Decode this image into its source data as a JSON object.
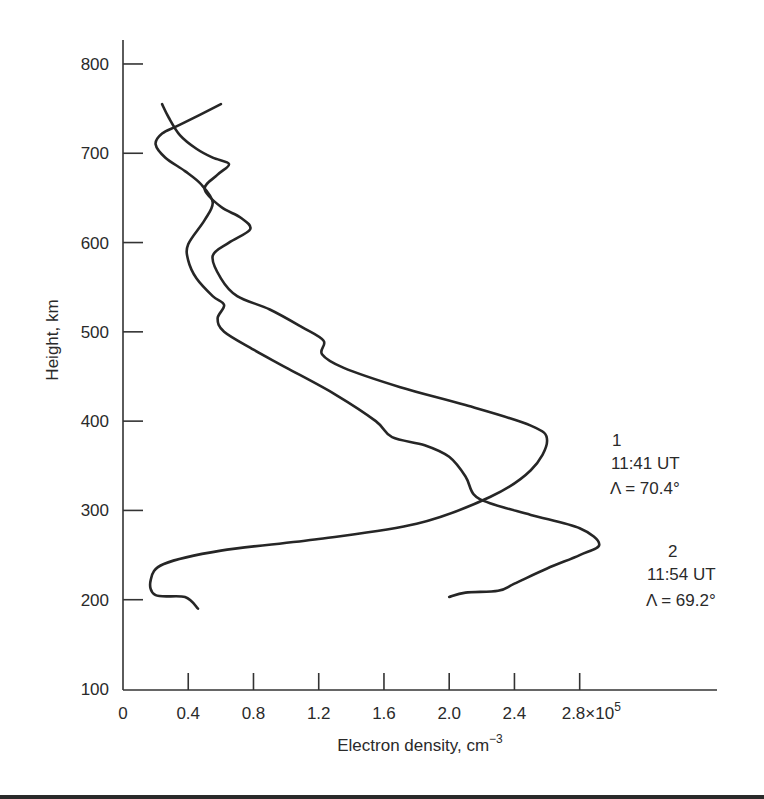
{
  "chart_data": {
    "type": "line",
    "title": "",
    "xlabel": "Electron density, cm⁻³",
    "ylabel": "Height, km",
    "xlim": [
      0,
      3.2
    ],
    "ylim": [
      100,
      830
    ],
    "x_multiplier": "×10⁵",
    "grid": false,
    "legend": "inline annotations",
    "x_ticks": [
      "0",
      "0.4",
      "0.8",
      "1.2",
      "1.6",
      "2.0",
      "2.4",
      "2.8×10⁵"
    ],
    "y_ticks": [
      "100",
      "200",
      "300",
      "400",
      "500",
      "600",
      "700",
      "800"
    ],
    "series": [
      {
        "name": "1",
        "time": "11:41 UT",
        "latitude": "Λ = 70.4°",
        "points": [
          [
            0.46,
            190
          ],
          [
            0.38,
            203
          ],
          [
            0.2,
            205
          ],
          [
            0.17,
            222
          ],
          [
            0.25,
            240
          ],
          [
            0.6,
            255
          ],
          [
            1.2,
            268
          ],
          [
            1.8,
            285
          ],
          [
            2.25,
            315
          ],
          [
            2.5,
            345
          ],
          [
            2.6,
            378
          ],
          [
            2.5,
            395
          ],
          [
            2.1,
            418
          ],
          [
            1.7,
            438
          ],
          [
            1.35,
            460
          ],
          [
            1.22,
            475
          ],
          [
            1.23,
            490
          ],
          [
            1.1,
            505
          ],
          [
            0.9,
            525
          ],
          [
            0.7,
            540
          ],
          [
            0.6,
            560
          ],
          [
            0.55,
            585
          ],
          [
            0.65,
            600
          ],
          [
            0.78,
            615
          ],
          [
            0.72,
            628
          ],
          [
            0.6,
            640
          ],
          [
            0.5,
            660
          ],
          [
            0.58,
            676
          ],
          [
            0.65,
            688
          ],
          [
            0.55,
            695
          ],
          [
            0.45,
            705
          ],
          [
            0.35,
            720
          ],
          [
            0.28,
            740
          ],
          [
            0.24,
            755
          ]
        ]
      },
      {
        "name": "2",
        "time": "11:54 UT",
        "latitude": "Λ = 69.2°",
        "points": [
          [
            2.0,
            203
          ],
          [
            2.1,
            208
          ],
          [
            2.3,
            210
          ],
          [
            2.4,
            218
          ],
          [
            2.6,
            235
          ],
          [
            2.8,
            250
          ],
          [
            2.92,
            262
          ],
          [
            2.8,
            280
          ],
          [
            2.5,
            295
          ],
          [
            2.25,
            308
          ],
          [
            2.15,
            318
          ],
          [
            2.1,
            338
          ],
          [
            2.0,
            360
          ],
          [
            1.85,
            373
          ],
          [
            1.65,
            382
          ],
          [
            1.55,
            400
          ],
          [
            1.3,
            430
          ],
          [
            1.0,
            460
          ],
          [
            0.8,
            480
          ],
          [
            0.62,
            500
          ],
          [
            0.58,
            515
          ],
          [
            0.62,
            530
          ],
          [
            0.55,
            540
          ],
          [
            0.45,
            560
          ],
          [
            0.4,
            580
          ],
          [
            0.4,
            598
          ],
          [
            0.5,
            625
          ],
          [
            0.55,
            645
          ],
          [
            0.48,
            665
          ],
          [
            0.38,
            680
          ],
          [
            0.26,
            695
          ],
          [
            0.2,
            710
          ],
          [
            0.24,
            722
          ],
          [
            0.35,
            732
          ],
          [
            0.6,
            755
          ]
        ]
      }
    ]
  },
  "annotations": {
    "curve1": {
      "label": "1",
      "time": "11:41 UT",
      "latitude": "Λ = 70.4°"
    },
    "curve2": {
      "label": "2",
      "time": "11:54 UT",
      "latitude": "Λ = 69.2°"
    }
  },
  "axes": {
    "x_title": "Electron density, cm",
    "x_title_sup": "−3",
    "y_title": "Height, km",
    "x_last_tick_main": "2.8×10",
    "x_last_tick_sup": "5"
  }
}
